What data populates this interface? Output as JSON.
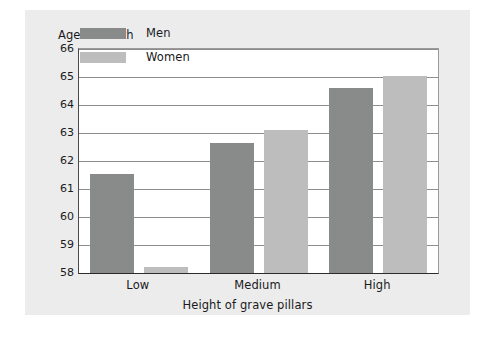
{
  "chart_data": {
    "type": "bar",
    "title": "",
    "xlabel": "Height of grave pillars",
    "ylabel": "Age at death",
    "categories": [
      "Low",
      "Medium",
      "High"
    ],
    "series": [
      {
        "name": "Men",
        "color": "#898b8b",
        "values": [
          61.55,
          62.65,
          64.6
        ]
      },
      {
        "name": "Women",
        "color": "#bdbdbd",
        "values": [
          58.2,
          63.1,
          65.05
        ]
      }
    ],
    "ylim": [
      58,
      66
    ],
    "y_ticks": [
      66,
      65,
      64,
      63,
      62,
      61,
      60,
      59,
      58
    ],
    "y_tick_labels": [
      "66",
      "65",
      "64",
      "63",
      "62",
      "61",
      "60",
      "59",
      "58"
    ],
    "grid": true,
    "legend_position": "upper-left-inside",
    "background_color": "#ececed",
    "plot_background_color": "#ffffff",
    "gridline_color": "#8d8d8d"
  },
  "legend": {
    "entries": [
      {
        "label": "Men",
        "swatch": "men-swatch"
      },
      {
        "label": "Women",
        "swatch": "women-swatch"
      }
    ]
  }
}
